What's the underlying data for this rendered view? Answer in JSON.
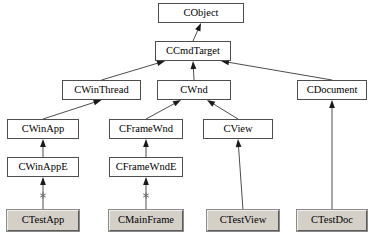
{
  "diagram": {
    "colors": {
      "box_border": "#4d4d4d",
      "box_fill": "#ffffff",
      "generated_fill": "#d4d0c8",
      "line": "#4d4d4d",
      "arrowhead": "#1a1a1a",
      "background": "#ffffff"
    },
    "nodes": [
      {
        "id": "cobject",
        "label": "CObject",
        "kind": "framework",
        "x": 158,
        "y": 3,
        "w": 86,
        "h": 20
      },
      {
        "id": "ccmdtarget",
        "label": "CCmdTarget",
        "kind": "framework",
        "x": 155,
        "y": 41,
        "w": 76,
        "h": 20
      },
      {
        "id": "cwinthread",
        "label": "CWinThread",
        "kind": "framework",
        "x": 62,
        "y": 80,
        "w": 79,
        "h": 20
      },
      {
        "id": "cwnd",
        "label": "CWnd",
        "kind": "framework",
        "x": 157,
        "y": 80,
        "w": 74,
        "h": 20
      },
      {
        "id": "cdocument",
        "label": "CDocument",
        "kind": "framework",
        "x": 297,
        "y": 80,
        "w": 70,
        "h": 20
      },
      {
        "id": "cwinapp",
        "label": "CWinApp",
        "kind": "framework",
        "x": 7,
        "y": 119,
        "w": 72,
        "h": 20
      },
      {
        "id": "cframewnd",
        "label": "CFrameWnd",
        "kind": "framework",
        "x": 109,
        "y": 119,
        "w": 74,
        "h": 20
      },
      {
        "id": "cview",
        "label": "CView",
        "kind": "framework",
        "x": 203,
        "y": 119,
        "w": 70,
        "h": 20
      },
      {
        "id": "cwinappe",
        "label": "CWinAppE",
        "kind": "framework",
        "x": 7,
        "y": 157,
        "w": 72,
        "h": 20
      },
      {
        "id": "cframewnde",
        "label": "CFrameWndE",
        "kind": "framework",
        "x": 109,
        "y": 157,
        "w": 74,
        "h": 20
      },
      {
        "id": "ctestapp",
        "label": "CTestApp",
        "kind": "generated",
        "x": 7,
        "y": 210,
        "w": 72,
        "h": 21
      },
      {
        "id": "cmainframe",
        "label": "CMainFrame",
        "kind": "generated",
        "x": 109,
        "y": 210,
        "w": 74,
        "h": 21
      },
      {
        "id": "ctestview",
        "label": "CTestView",
        "kind": "generated",
        "x": 207,
        "y": 210,
        "w": 72,
        "h": 21
      },
      {
        "id": "ctestdoc",
        "label": "CTestDoc",
        "kind": "generated",
        "x": 297,
        "y": 210,
        "w": 70,
        "h": 21
      }
    ],
    "edges": [
      {
        "id": "e1",
        "from": "ccmdtarget",
        "to": "cobject",
        "type": "inheritance",
        "marker": "none"
      },
      {
        "id": "e2",
        "from": "cwinthread",
        "to": "ccmdtarget",
        "type": "inheritance",
        "marker": "none"
      },
      {
        "id": "e3",
        "from": "cwnd",
        "to": "ccmdtarget",
        "type": "inheritance",
        "marker": "none"
      },
      {
        "id": "e4",
        "from": "cdocument",
        "to": "ccmdtarget",
        "type": "inheritance",
        "marker": "none"
      },
      {
        "id": "e5",
        "from": "cwinapp",
        "to": "cwinthread",
        "type": "inheritance",
        "marker": "none"
      },
      {
        "id": "e6",
        "from": "cframewnd",
        "to": "cwnd",
        "type": "inheritance",
        "marker": "none"
      },
      {
        "id": "e7",
        "from": "cview",
        "to": "cwnd",
        "type": "inheritance",
        "marker": "none"
      },
      {
        "id": "e8",
        "from": "cwinappe",
        "to": "cwinapp",
        "type": "inheritance",
        "marker": "none"
      },
      {
        "id": "e9",
        "from": "cframewnde",
        "to": "cframewnd",
        "type": "inheritance",
        "marker": "none"
      },
      {
        "id": "e10",
        "from": "ctestapp",
        "to": "cwinappe",
        "type": "inheritance",
        "marker": "asterisk"
      },
      {
        "id": "e11",
        "from": "cmainframe",
        "to": "cframewnde",
        "type": "inheritance",
        "marker": "asterisk"
      },
      {
        "id": "e12",
        "from": "ctestview",
        "to": "cview",
        "type": "inheritance",
        "marker": "none"
      },
      {
        "id": "e13",
        "from": "ctestdoc",
        "to": "cdocument",
        "type": "inheritance",
        "marker": "none"
      }
    ]
  }
}
